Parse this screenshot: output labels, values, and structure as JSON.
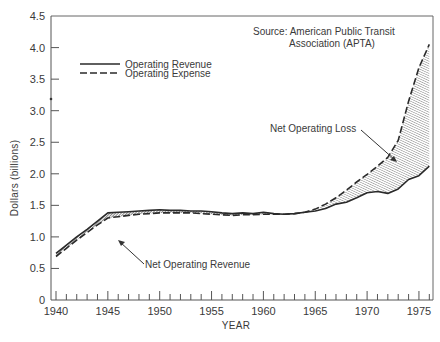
{
  "chart_data": {
    "type": "line",
    "title": "",
    "xlabel": "YEAR",
    "ylabel": "Dollars (billions)",
    "xlim": [
      1939.5,
      1976.5
    ],
    "ylim": [
      0,
      4.5
    ],
    "xticks": [
      1940,
      1945,
      1950,
      1955,
      1960,
      1965,
      1970,
      1975
    ],
    "xtick_labels": [
      "1940",
      "1945",
      "1950",
      "1955",
      "1960",
      "1965",
      "1970",
      "1975"
    ],
    "yticks": [
      0,
      0.5,
      1.0,
      1.5,
      2.0,
      2.5,
      3.0,
      3.5,
      4.0,
      4.5
    ],
    "ytick_labels": [
      "0",
      "0.5",
      "1.0",
      "1.5",
      "2.0",
      "2.5",
      "3.0",
      "3.5",
      "4.0",
      "4.5"
    ],
    "grid": false,
    "legend_position": "upper left",
    "series": [
      {
        "name": "Operating Revenue",
        "style": "solid",
        "x": [
          1940,
          1941,
          1942,
          1943,
          1944,
          1945,
          1946,
          1947,
          1948,
          1949,
          1950,
          1951,
          1952,
          1953,
          1954,
          1955,
          1956,
          1957,
          1958,
          1959,
          1960,
          1961,
          1962,
          1963,
          1964,
          1965,
          1966,
          1967,
          1968,
          1969,
          1970,
          1971,
          1972,
          1973,
          1974,
          1975,
          1976
        ],
        "values": [
          0.74,
          0.87,
          1.0,
          1.12,
          1.25,
          1.38,
          1.39,
          1.4,
          1.41,
          1.42,
          1.43,
          1.42,
          1.42,
          1.41,
          1.41,
          1.4,
          1.38,
          1.37,
          1.38,
          1.37,
          1.39,
          1.37,
          1.36,
          1.37,
          1.39,
          1.41,
          1.45,
          1.52,
          1.55,
          1.62,
          1.7,
          1.72,
          1.69,
          1.76,
          1.91,
          1.97,
          2.12
        ]
      },
      {
        "name": "Operating Expense",
        "style": "dashed",
        "x": [
          1940,
          1941,
          1942,
          1943,
          1944,
          1945,
          1946,
          1947,
          1948,
          1949,
          1950,
          1951,
          1952,
          1953,
          1954,
          1955,
          1956,
          1957,
          1958,
          1959,
          1960,
          1961,
          1962,
          1963,
          1964,
          1965,
          1966,
          1967,
          1968,
          1969,
          1970,
          1971,
          1972,
          1973,
          1974,
          1975,
          1976
        ],
        "values": [
          0.69,
          0.82,
          0.95,
          1.07,
          1.19,
          1.3,
          1.32,
          1.34,
          1.36,
          1.37,
          1.38,
          1.38,
          1.38,
          1.38,
          1.37,
          1.36,
          1.35,
          1.34,
          1.35,
          1.35,
          1.36,
          1.36,
          1.36,
          1.37,
          1.39,
          1.44,
          1.52,
          1.62,
          1.74,
          1.87,
          1.99,
          2.12,
          2.26,
          2.53,
          3.15,
          3.68,
          4.05
        ]
      }
    ],
    "annotations": [
      {
        "text": "Net Operating Revenue",
        "points_to": "gap between revenue and expense, 1940-1962"
      },
      {
        "text": "Net Operating Loss",
        "points_to": "gap between expense and revenue, 1963-1976"
      },
      {
        "text": "Source: American Public Transit Association (APTA)",
        "position": "upper right"
      }
    ]
  },
  "labels": {
    "ylabel": "Dollars (billions)",
    "xlabel": "YEAR",
    "legend": {
      "revenue": "Operating Revenue",
      "expense": "Operating Expense"
    },
    "source_line1": "Source: American Public Transit",
    "source_line2": "Association (APTA)",
    "net_revenue": "Net Operating Revenue",
    "net_loss": "Net Operating Loss"
  },
  "colors": {
    "ink": "#2a2a2a",
    "text": "#3a3a3a",
    "axis": "#555555"
  }
}
